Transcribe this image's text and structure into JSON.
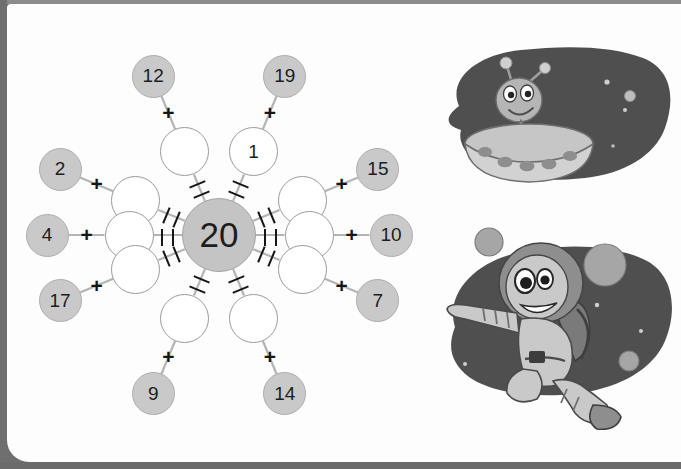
{
  "page": {
    "background_color": "#fdfdfd",
    "border_color": "#6e6e6e"
  },
  "wheel": {
    "center": {
      "value": "20",
      "fill": "#c4c4c4",
      "stroke": "#a3a3a3"
    },
    "given_fill": "#c9c9c9",
    "blank_fill": "#ffffff",
    "plus_symbol": "+",
    "equals_symbol": "=",
    "spokes": [
      {
        "id": "nw",
        "given": "2",
        "answer": "",
        "angle_deg": 202.5,
        "filled": false
      },
      {
        "id": "nnw",
        "given": "12",
        "answer": "",
        "angle_deg": 247.5,
        "filled": false
      },
      {
        "id": "nne",
        "given": "19",
        "answer": "1",
        "angle_deg": 292.5,
        "filled": true
      },
      {
        "id": "ne",
        "given": "15",
        "answer": "",
        "angle_deg": 337.5,
        "filled": false
      },
      {
        "id": "w",
        "given": "4",
        "answer": "",
        "angle_deg": 180.0,
        "filled": false
      },
      {
        "id": "e",
        "given": "10",
        "answer": "",
        "angle_deg": 0.0,
        "filled": false
      },
      {
        "id": "sw",
        "given": "17",
        "answer": "",
        "angle_deg": 157.5,
        "filled": false
      },
      {
        "id": "ssw",
        "given": "9",
        "answer": "",
        "angle_deg": 112.5,
        "filled": false
      },
      {
        "id": "sse",
        "given": "14",
        "answer": "",
        "angle_deg": 67.5,
        "filled": false
      },
      {
        "id": "se",
        "given": "7",
        "answer": "",
        "angle_deg": 22.5,
        "filled": false
      }
    ]
  },
  "chart_data": {
    "type": "diagram",
    "target": 20,
    "given_numbers": [
      12,
      19,
      15,
      10,
      7,
      14,
      9,
      17,
      4,
      2
    ],
    "answers": [
      "",
      "1",
      "",
      "",
      "",
      "",
      "",
      "",
      "",
      ""
    ],
    "relation": "given + blank = 20"
  },
  "illustrations": [
    {
      "id": "alien-saucer",
      "name": "alien-in-flying-saucer",
      "blob_color": "#4f4f4f",
      "body_color": "#b0b0b0",
      "stars": 4
    },
    {
      "id": "astronaut",
      "name": "astronaut-floating-in-space",
      "blob_color": "#4f4f4f",
      "suit_color": "#bdbdbd",
      "planets": 3
    }
  ]
}
